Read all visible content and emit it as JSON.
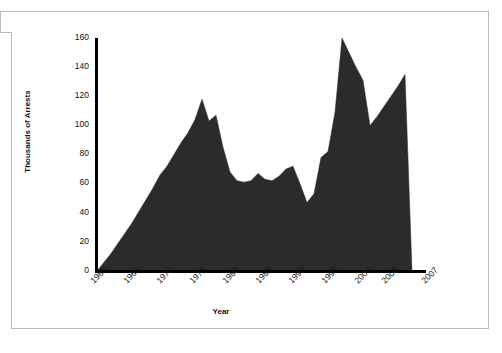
{
  "chart_data": {
    "type": "area",
    "title": "",
    "xlabel": "Year",
    "ylabel": "Thousands of Arrests",
    "xlim": [
      1960,
      2007
    ],
    "ylim": [
      0,
      160
    ],
    "grid": false,
    "legend": "none",
    "fill_color": "#2b2b2b",
    "axis_color": "#000000",
    "y_ticks": [
      160,
      140,
      120,
      100,
      80,
      60,
      40,
      20,
      0
    ],
    "x_ticks": [
      1960,
      1965,
      1970,
      1975,
      1980,
      1985,
      1990,
      1995,
      2000,
      2004,
      2007
    ],
    "x": [
      1960,
      1961,
      1962,
      1963,
      1964,
      1965,
      1966,
      1967,
      1968,
      1969,
      1970,
      1971,
      1972,
      1973,
      1974,
      1975,
      1976,
      1977,
      1978,
      1979,
      1980,
      1981,
      1982,
      1983,
      1984,
      1985,
      1986,
      1987,
      1988,
      1989,
      1990,
      1991,
      1992,
      1993,
      1994,
      1995,
      1996,
      1997,
      1998,
      1999,
      2000,
      2001,
      2002,
      2003,
      2004,
      2005
    ],
    "values": [
      0,
      6,
      12,
      19,
      26,
      33,
      41,
      49,
      57,
      66,
      72,
      80,
      88,
      95,
      104,
      118,
      103,
      107,
      85,
      68,
      62,
      61,
      62,
      67,
      63,
      62,
      65,
      70,
      72,
      60,
      47,
      53,
      78,
      82,
      109,
      160,
      150,
      140,
      131,
      100,
      106,
      113,
      120,
      127,
      135,
      0
    ],
    "series": [
      {
        "name": "Arrests",
        "values": [
          0,
          6,
          12,
          19,
          26,
          33,
          41,
          49,
          57,
          66,
          72,
          80,
          88,
          95,
          104,
          118,
          103,
          107,
          85,
          68,
          62,
          61,
          62,
          67,
          63,
          62,
          65,
          70,
          72,
          60,
          47,
          53,
          78,
          82,
          109,
          160,
          150,
          140,
          131,
          100,
          106,
          113,
          120,
          127,
          135,
          0
        ]
      }
    ]
  }
}
